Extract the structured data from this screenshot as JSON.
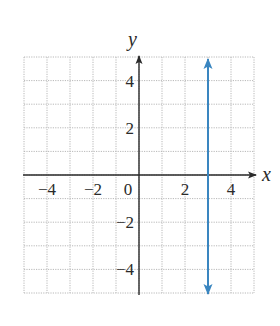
{
  "chart_data": {
    "type": "line",
    "title": "",
    "xlabel": "x",
    "ylabel": "y",
    "xlim": [
      -5,
      5
    ],
    "ylim": [
      -5,
      5
    ],
    "grid": true,
    "grid_style": "dotted",
    "x_ticks": [
      -4,
      -2,
      0,
      2,
      4
    ],
    "y_ticks": [
      -4,
      -2,
      2,
      4
    ],
    "x_tick_labels": [
      "−4",
      "−2",
      "0",
      "2",
      "4"
    ],
    "y_tick_labels": [
      "−4",
      "−2",
      "2",
      "4"
    ],
    "series": [
      {
        "name": "x = 3",
        "kind": "vertical-line",
        "x": [
          3,
          3
        ],
        "y": [
          -5,
          5
        ],
        "arrows": "both",
        "color": "#3a86c0"
      }
    ],
    "legend": null
  },
  "colors": {
    "axis": "#2a2a2a",
    "grid": "#b8b8b8",
    "line": "#3a86c0"
  }
}
